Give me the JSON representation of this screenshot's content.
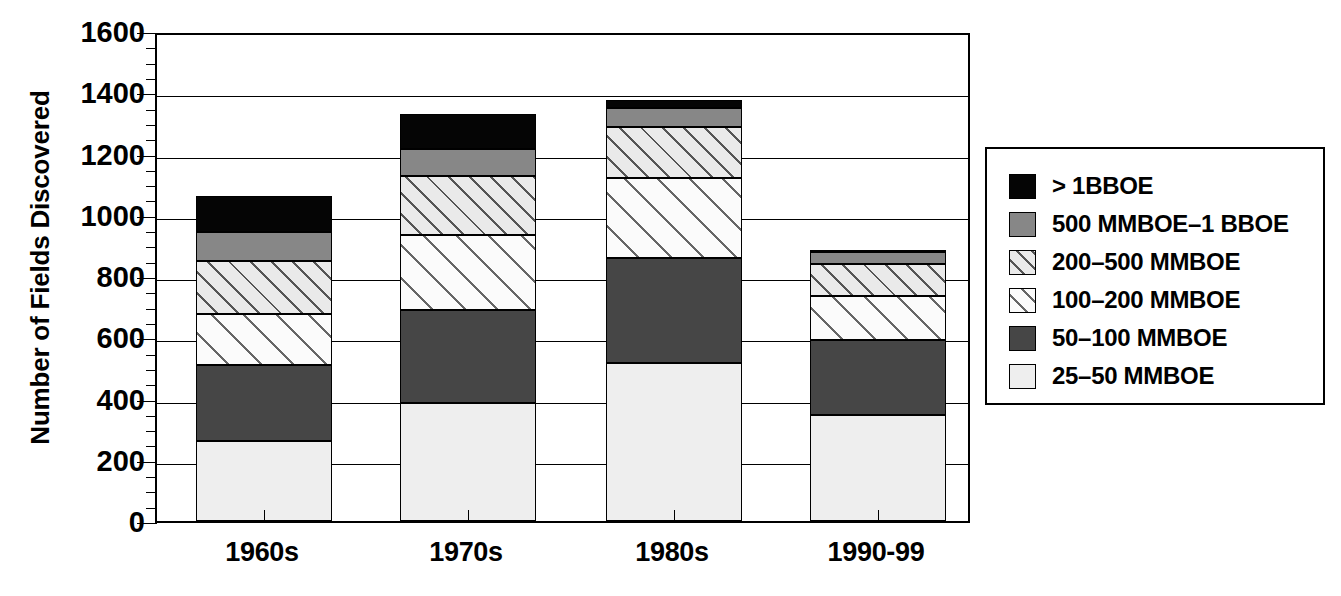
{
  "chart_data": {
    "type": "bar",
    "subtype": "stacked-vertical",
    "title": "",
    "xlabel": "",
    "ylabel": "Number of Fields Discovered",
    "categories": [
      "1960s",
      "1970s",
      "1980s",
      "1990-99"
    ],
    "ylim": [
      0,
      1600
    ],
    "ytick_labels": [
      "0",
      "200",
      "400",
      "600",
      "800",
      "1000",
      "1200",
      "1400",
      "1600"
    ],
    "ytick_values": [
      0,
      200,
      400,
      600,
      800,
      1000,
      1200,
      1400,
      1600
    ],
    "yminor_interval": 50,
    "grid": true,
    "grid_axis": "y",
    "legend_position": "right-outside",
    "stack_order_bottom_to_top": [
      "25-50 MMBOE",
      "50-100 MMBOE",
      "100-200 MMBOE",
      "200-500 MMBOE",
      "500 MMBOE-1 BBOE",
      "> 1BBOE"
    ],
    "series": [
      {
        "name": "> 1BBOE",
        "color": "#050505",
        "pattern": "solid",
        "values": [
          115,
          115,
          25,
          5
        ]
      },
      {
        "name": "500 MMBOE-1 BBOE",
        "color": "#878787",
        "pattern": "solid",
        "values": [
          95,
          90,
          65,
          40
        ]
      },
      {
        "name": "200-500 MMBOE",
        "color": "#eaeaea",
        "pattern": "diagonal-hatch-dense",
        "values": [
          175,
          190,
          165,
          105
        ]
      },
      {
        "name": "100-200 MMBOE",
        "color": "#fbfbfb",
        "pattern": "diagonal-hatch-sparse",
        "values": [
          165,
          245,
          260,
          145
        ]
      },
      {
        "name": "50-100 MMBOE",
        "color": "#464646",
        "pattern": "solid",
        "values": [
          250,
          305,
          345,
          245
        ]
      },
      {
        "name": "25-50 MMBOE",
        "color": "#eeeeee",
        "pattern": "solid",
        "values": [
          260,
          385,
          515,
          345
        ]
      }
    ],
    "totals": [
      1060,
      1330,
      1375,
      885
    ],
    "cumulative_tops": {
      "1960s": {
        "25-50 MMBOE": 260,
        "50-100 MMBOE": 510,
        "100-200 MMBOE": 675,
        "200-500 MMBOE": 850,
        "500 MMBOE-1 BBOE": 945,
        "> 1BBOE": 1060
      },
      "1970s": {
        "25-50 MMBOE": 385,
        "50-100 MMBOE": 690,
        "100-200 MMBOE": 935,
        "200-500 MMBOE": 1125,
        "500 MMBOE-1 BBOE": 1215,
        "> 1BBOE": 1330
      },
      "1980s": {
        "25-50 MMBOE": 515,
        "50-100 MMBOE": 860,
        "100-200 MMBOE": 1120,
        "200-500 MMBOE": 1285,
        "500 MMBOE-1 BBOE": 1350,
        "> 1BBOE": 1375
      },
      "1990-99": {
        "25-50 MMBOE": 345,
        "50-100 MMBOE": 590,
        "100-200 MMBOE": 735,
        "200-500 MMBOE": 840,
        "500 MMBOE-1 BBOE": 880,
        "> 1BBOE": 885
      }
    }
  },
  "axis": {
    "y_title": "Number of Fields Discovered",
    "y_ticks": [
      {
        "label": "1600",
        "value": 1600
      },
      {
        "label": "1400",
        "value": 1400
      },
      {
        "label": "1200",
        "value": 1200
      },
      {
        "label": "1000",
        "value": 1000
      },
      {
        "label": "800",
        "value": 800
      },
      {
        "label": "600",
        "value": 600
      },
      {
        "label": "400",
        "value": 400
      },
      {
        "label": "200",
        "value": 200
      },
      {
        "label": "0",
        "value": 0
      }
    ],
    "x_categories": [
      {
        "label": "1960s"
      },
      {
        "label": "1970s"
      },
      {
        "label": "1980s"
      },
      {
        "label": "1990-99"
      }
    ]
  },
  "legend": {
    "items": [
      {
        "label": "> 1BBOE",
        "swatch": "swatch-gt-1bboe",
        "fill_class": "fill-gt1bboe"
      },
      {
        "label": "500 MMBOE–1 BBOE",
        "swatch": "swatch-500-1bboe",
        "fill_class": "fill-500-1bboe"
      },
      {
        "label": "200–500 MMBOE",
        "swatch": "swatch-200-500",
        "fill_class": "fill-200-500"
      },
      {
        "label": "100–200 MMBOE",
        "swatch": "swatch-100-200",
        "fill_class": "fill-100-200"
      },
      {
        "label": "50–100 MMBOE",
        "swatch": "swatch-50-100",
        "fill_class": "fill-50-100"
      },
      {
        "label": "25–50 MMBOE",
        "swatch": "swatch-25-50",
        "fill_class": "fill-25-50"
      }
    ]
  },
  "colors": {
    "axis": "#000000",
    "background": "#ffffff",
    "gt_1bboe": "#050505",
    "mmboe_500_1bboe": "#878787",
    "mmboe_200_500": "#eaeaea",
    "mmboe_100_200": "#fbfbfb",
    "mmboe_50_100": "#464646",
    "mmboe_25_50": "#eeeeee"
  }
}
